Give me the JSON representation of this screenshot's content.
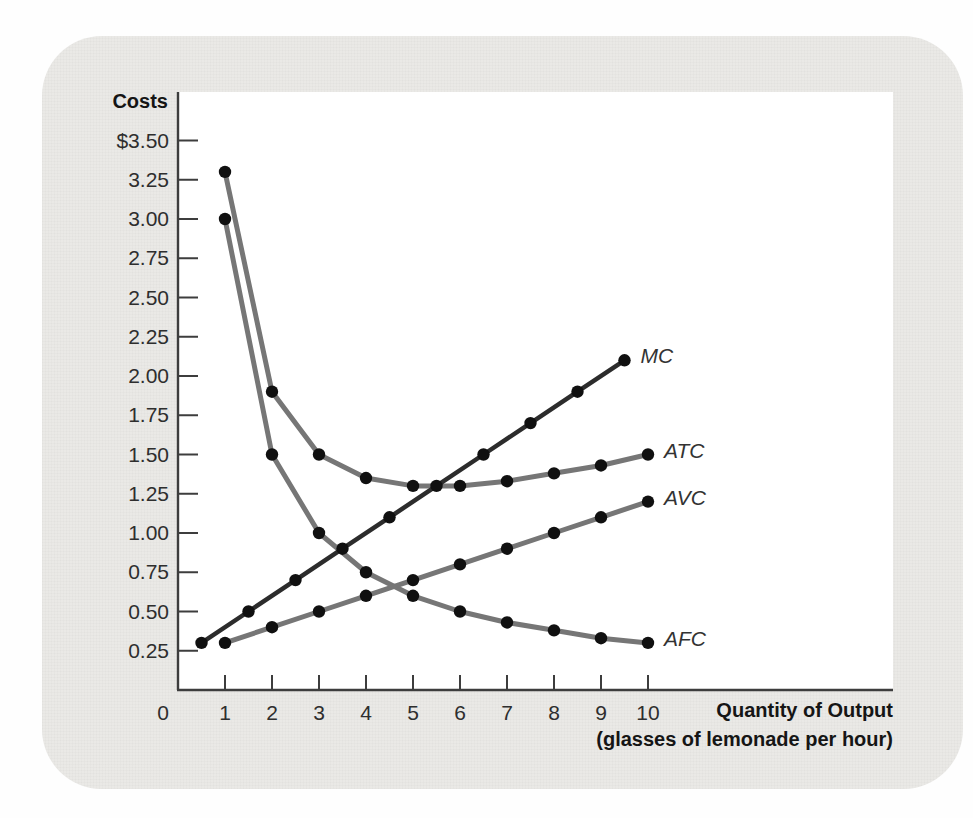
{
  "figure": {
    "y_axis_title": "Costs",
    "x_axis_title_line1": "Quantity of Output",
    "x_axis_title_line2": "(glasses of lemonade per hour)",
    "card_bg": "#eae9e6",
    "plot_bg": "#ffffff",
    "axis_color": "#3d3d3d",
    "tick_text_color": "#2e2e2e",
    "dot_color": "#101010"
  },
  "chart_data": {
    "type": "line",
    "title": "",
    "ylabel": "Costs",
    "xlabel": "Quantity of Output (glasses of lemonade per hour)",
    "xlim": [
      0,
      10.6
    ],
    "ylim": [
      0,
      3.75
    ],
    "grid": false,
    "legend_position": "inline labels at right end of each curve",
    "x_ticks": [
      {
        "v": 0,
        "label": "0"
      },
      {
        "v": 1,
        "label": "1"
      },
      {
        "v": 2,
        "label": "2"
      },
      {
        "v": 3,
        "label": "3"
      },
      {
        "v": 4,
        "label": "4"
      },
      {
        "v": 5,
        "label": "5"
      },
      {
        "v": 6,
        "label": "6"
      },
      {
        "v": 7,
        "label": "7"
      },
      {
        "v": 8,
        "label": "8"
      },
      {
        "v": 9,
        "label": "9"
      },
      {
        "v": 10,
        "label": "10"
      }
    ],
    "y_ticks": [
      {
        "v": 3.5,
        "label": "$3.50"
      },
      {
        "v": 3.25,
        "label": "3.25"
      },
      {
        "v": 3.0,
        "label": "3.00"
      },
      {
        "v": 2.75,
        "label": "2.75"
      },
      {
        "v": 2.5,
        "label": "2.50"
      },
      {
        "v": 2.25,
        "label": "2.25"
      },
      {
        "v": 2.0,
        "label": "2.00"
      },
      {
        "v": 1.75,
        "label": "1.75"
      },
      {
        "v": 1.5,
        "label": "1.50"
      },
      {
        "v": 1.25,
        "label": "1.25"
      },
      {
        "v": 1.0,
        "label": "1.00"
      },
      {
        "v": 0.75,
        "label": "0.75"
      },
      {
        "v": 0.5,
        "label": "0.50"
      },
      {
        "v": 0.25,
        "label": "0.25"
      }
    ],
    "series": [
      {
        "name": "MC",
        "color": "#2c2c2c",
        "line_width": 4.5,
        "x": [
          0.5,
          1.5,
          2.5,
          3.5,
          4.5,
          5.5,
          6.5,
          7.5,
          8.5,
          9.5
        ],
        "values": [
          0.3,
          0.5,
          0.7,
          0.9,
          1.1,
          1.3,
          1.5,
          1.7,
          1.9,
          2.1
        ]
      },
      {
        "name": "ATC",
        "color": "#767676",
        "line_width": 5,
        "x": [
          1,
          2,
          3,
          4,
          5,
          6,
          7,
          8,
          9,
          10
        ],
        "values": [
          3.3,
          1.9,
          1.5,
          1.35,
          1.3,
          1.3,
          1.33,
          1.38,
          1.43,
          1.5
        ]
      },
      {
        "name": "AVC",
        "color": "#767676",
        "line_width": 5,
        "x": [
          1,
          2,
          3,
          4,
          5,
          6,
          7,
          8,
          9,
          10
        ],
        "values": [
          0.3,
          0.4,
          0.5,
          0.6,
          0.7,
          0.8,
          0.9,
          1.0,
          1.1,
          1.2
        ]
      },
      {
        "name": "AFC",
        "color": "#767676",
        "line_width": 5,
        "x": [
          1,
          2,
          3,
          4,
          5,
          6,
          7,
          8,
          9,
          10
        ],
        "values": [
          3.0,
          1.5,
          1.0,
          0.75,
          0.6,
          0.5,
          0.43,
          0.38,
          0.33,
          0.3
        ]
      }
    ]
  }
}
